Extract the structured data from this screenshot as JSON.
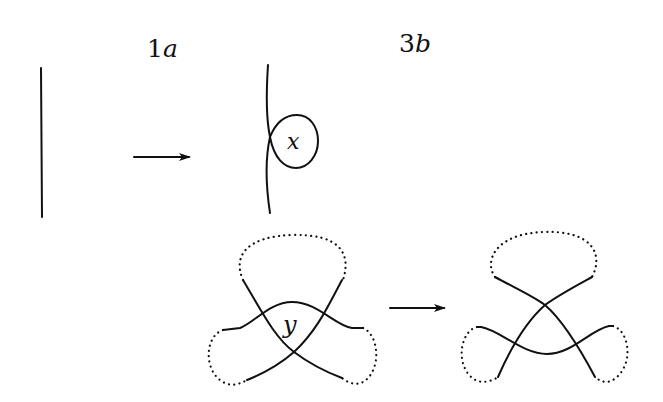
{
  "figure": {
    "labels": {
      "move_1": {
        "num": "1",
        "letter": "a"
      },
      "move_2": {
        "num": "3",
        "letter": "b"
      },
      "region_x": "x",
      "region_y": "y"
    },
    "panels": [
      {
        "name": "1a-before",
        "description": "single vertical strand"
      },
      {
        "name": "1a-after",
        "description": "strand with a kink loop enclosing region x"
      },
      {
        "name": "3b-before",
        "description": "three strands crossing around triangular region y, ends joined by dotted arcs"
      },
      {
        "name": "3b-after",
        "description": "three strands after triangle move, region removed"
      }
    ],
    "arrows": [
      {
        "name": "arrow-1a",
        "direction": "right"
      },
      {
        "name": "arrow-3b",
        "direction": "right"
      }
    ],
    "colors": {
      "stroke": "#111111",
      "background": "#ffffff"
    }
  }
}
